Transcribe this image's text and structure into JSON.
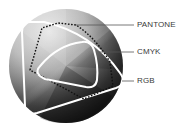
{
  "diagram": {
    "labels": {
      "pantone": "PANTONE",
      "cmyk": "CMYK",
      "rgb": "RGB"
    },
    "colors": {
      "background": "#ffffff",
      "sphere_light": "#d6d6d6",
      "sphere_mid": "#9a9a9a",
      "sphere_dark": "#1e1e1e",
      "rgb_outline": "#ffffff",
      "cmyk_outline": "#ffffff",
      "pantone_outline": "#111111",
      "leader_line": "#555555",
      "label_text": "#3a3a3a"
    },
    "legend": [
      {
        "name": "PANTONE",
        "style": "dashed-dark",
        "leader_y": 25
      },
      {
        "name": "CMYK",
        "style": "solid-white-inner",
        "leader_y": 52
      },
      {
        "name": "RGB",
        "style": "solid-white-outer",
        "leader_y": 81
      }
    ]
  }
}
